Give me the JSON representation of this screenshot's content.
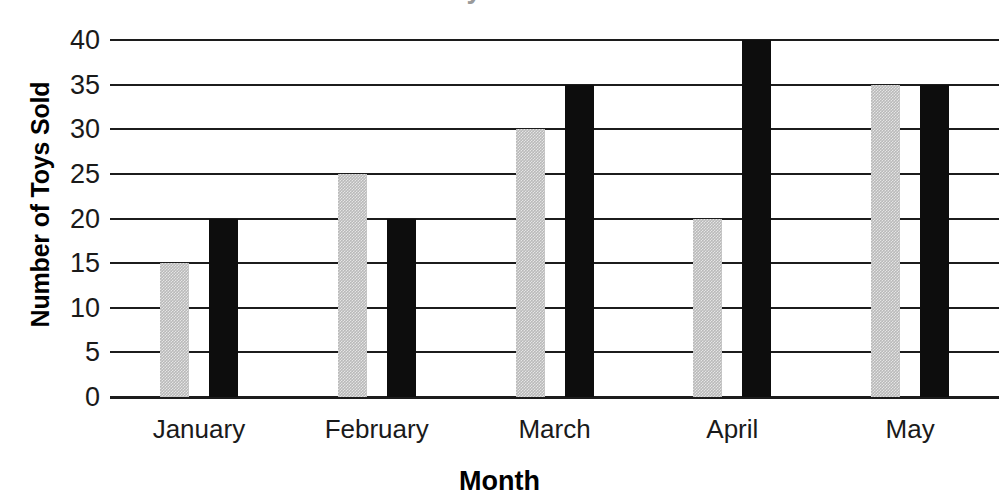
{
  "chart_data": {
    "type": "bar",
    "title": "",
    "xlabel": "Month",
    "ylabel": "Number of Toys Sold",
    "categories": [
      "January",
      "February",
      "March",
      "April",
      "May"
    ],
    "series": [
      {
        "name": "gray-series",
        "color": "#b9b9b9",
        "values": [
          15,
          25,
          30,
          20,
          35
        ]
      },
      {
        "name": "black-series",
        "color": "#0d0d0d",
        "values": [
          20,
          20,
          35,
          40,
          35
        ]
      }
    ],
    "yticks": [
      0,
      5,
      10,
      15,
      20,
      25,
      30,
      35,
      40
    ],
    "ylim": [
      0,
      40
    ],
    "grid": true,
    "legend": "none",
    "ytick_labels": [
      "0",
      "5",
      "10",
      "15",
      "20",
      "25",
      "30",
      "35",
      "40"
    ]
  },
  "axis": {
    "y_title": "Number of Toys Sold",
    "x_title": "Month"
  },
  "title_fragment": "Toys Sold"
}
